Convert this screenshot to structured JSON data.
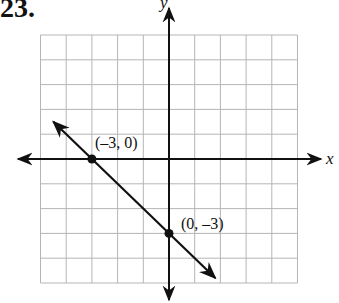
{
  "problem_number": "23.",
  "chart_data": {
    "type": "line",
    "title": "",
    "xlabel": "x",
    "ylabel": "y",
    "xlim": [
      -5,
      5
    ],
    "ylim": [
      -5,
      5
    ],
    "grid": true,
    "grid_step": 1,
    "line": {
      "slope": -1,
      "intercept": -3,
      "equation": "y = -x - 3",
      "arrows_both_ends": true
    },
    "points": [
      {
        "x": -3,
        "y": 0,
        "label": "(-3, 0)"
      },
      {
        "x": 0,
        "y": -3,
        "label": "(0, -3)"
      }
    ]
  },
  "labels": {
    "x_axis": "x",
    "y_axis": "y",
    "point1": "(–3, 0)",
    "point2": "(0, –3)"
  }
}
